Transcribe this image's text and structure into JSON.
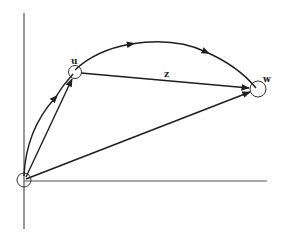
{
  "diagram": {
    "type": "vector-diagram",
    "colors": {
      "stroke": "#1e1e1e",
      "axis": "#555555",
      "background": "#ffffff"
    },
    "axes": {
      "vertical": {
        "x": 24,
        "y1": 13,
        "y2": 229
      },
      "horizontal": {
        "y": 181,
        "x1": 24,
        "x2": 267
      }
    },
    "nodes": [
      {
        "id": "origin",
        "label": "",
        "cx": 24,
        "cy": 180,
        "r": 7
      },
      {
        "id": "u",
        "label": "u",
        "cx": 75,
        "cy": 72,
        "r": 6.5,
        "label_x": 71,
        "label_y": 64
      },
      {
        "id": "w",
        "label": "w",
        "cx": 258,
        "cy": 89,
        "r": 8,
        "label_x": 263,
        "label_y": 82
      }
    ],
    "edges": [
      {
        "id": "origin-to-u-straight",
        "from": "origin",
        "to": "u",
        "kind": "straight",
        "label": ""
      },
      {
        "id": "u-to-w",
        "from": "u",
        "to": "w",
        "kind": "straight",
        "label": "z",
        "label_x": 164,
        "label_y": 77
      },
      {
        "id": "origin-to-w",
        "from": "origin",
        "to": "w",
        "kind": "straight",
        "label": ""
      },
      {
        "id": "origin-to-u-curve",
        "from": "origin",
        "to": "u",
        "kind": "curve",
        "label": ""
      },
      {
        "id": "u-to-w-arc",
        "from": "u",
        "to": "w",
        "kind": "arc",
        "label": ""
      }
    ],
    "labels": {
      "u": "u",
      "w": "w",
      "z": "z"
    }
  }
}
